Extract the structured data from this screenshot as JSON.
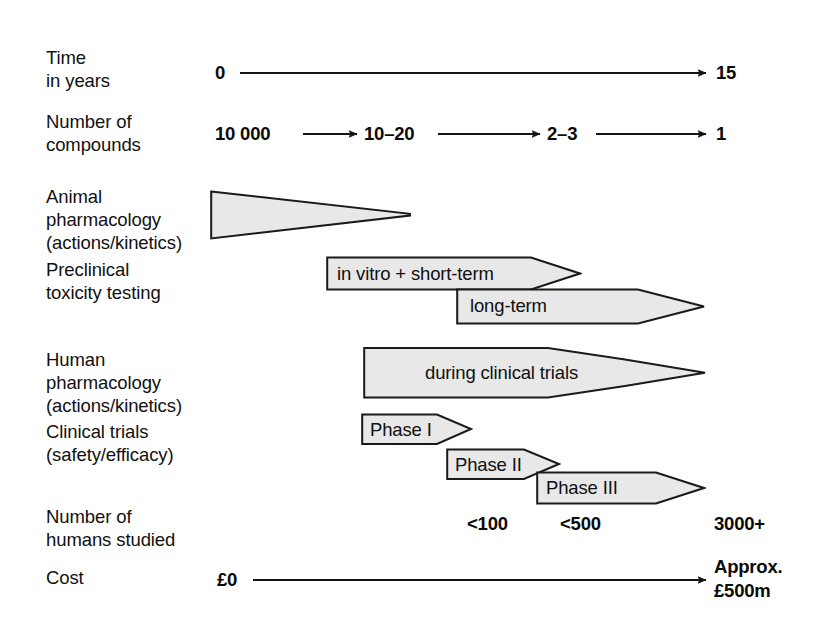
{
  "diagram": {
    "fill_color": "#e8e8e8",
    "stroke_color": "#1a1a1a",
    "text_color": "#111111",
    "background": "#ffffff"
  },
  "rows": [
    {
      "id": "time",
      "label": "Time\nin years"
    },
    {
      "id": "compounds",
      "label": "Number of\ncompounds"
    },
    {
      "id": "animal-pharm",
      "label": "Animal\npharmacology\n(actions/kinetics)"
    },
    {
      "id": "preclinical-tox",
      "label": "Preclinical\ntoxicity testing"
    },
    {
      "id": "human-pharm",
      "label": "Human\npharmacology\n(actions/kinetics)"
    },
    {
      "id": "clinical-trials",
      "label": "Clinical trials\n(safety/efficacy)"
    },
    {
      "id": "humans-studied",
      "label": "Number of\nhumans studied"
    },
    {
      "id": "cost",
      "label": "Cost"
    }
  ],
  "timeline": {
    "start_label": "0",
    "end_label": "15"
  },
  "compounds_chain": {
    "steps": [
      "10 000",
      "10–20",
      "2–3",
      "1"
    ]
  },
  "shapes": {
    "animal_pharmacology": {
      "label": ""
    },
    "in_vitro_short_term": {
      "label": "in vitro + short-term"
    },
    "long_term": {
      "label": "long-term"
    },
    "during_clinical_trials": {
      "label": "during clinical trials"
    },
    "phase_1": {
      "label": "Phase I"
    },
    "phase_2": {
      "label": "Phase II"
    },
    "phase_3": {
      "label": "Phase III"
    }
  },
  "humans_studied": {
    "phase1_count": "<100",
    "phase2_count": "<500",
    "phase3_count": "3000+"
  },
  "cost": {
    "start_label": "£0",
    "end_label_line1": "Approx.",
    "end_label_line2": "£500m"
  }
}
